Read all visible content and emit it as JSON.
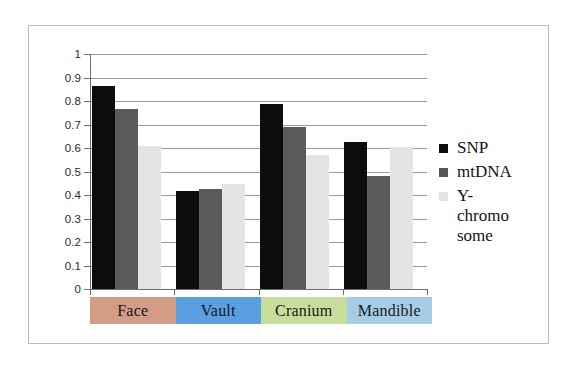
{
  "chart_data": {
    "type": "bar",
    "title": "",
    "xlabel": "",
    "ylabel": "",
    "ylim": [
      0,
      1
    ],
    "grid": true,
    "legend_position": "right",
    "categories": [
      "Face",
      "Vault",
      "Cranium",
      "Mandible"
    ],
    "y_ticks": [
      "1",
      "0.9",
      "0.8",
      "0.7",
      "0.6",
      "0.5",
      "0.4",
      "0.3",
      "0.2",
      "0.1",
      "0"
    ],
    "y_tick_values": [
      1,
      0.9,
      0.8,
      0.7,
      0.6,
      0.5,
      0.4,
      0.3,
      0.2,
      0.1,
      0
    ],
    "series": [
      {
        "name": "SNP",
        "color": "#0d0d0d",
        "values": [
          0.865,
          0.415,
          0.787,
          0.625
        ]
      },
      {
        "name": "mtDNA",
        "color": "#5b5b5b",
        "values": [
          0.765,
          0.425,
          0.688,
          0.48
        ]
      },
      {
        "name": "Y-chromosome",
        "color": "#e4e4e4",
        "values": [
          0.61,
          0.445,
          0.572,
          0.603
        ]
      }
    ]
  },
  "legend": {
    "entries": [
      {
        "label": "SNP",
        "swatch": "snp"
      },
      {
        "label": "mtDNA",
        "swatch": "mtdna"
      },
      {
        "label": "Y-\nchromo\nsome",
        "swatch": "ychromo"
      }
    ]
  },
  "category_axis": {
    "labels": [
      {
        "text": "Face",
        "background": "#d49b85"
      },
      {
        "text": "Vault",
        "background": "#5a9fe0"
      },
      {
        "text": "Cranium",
        "background": "#c6dd9c"
      },
      {
        "text": "Mandible",
        "background": "#a5cde6"
      }
    ]
  }
}
